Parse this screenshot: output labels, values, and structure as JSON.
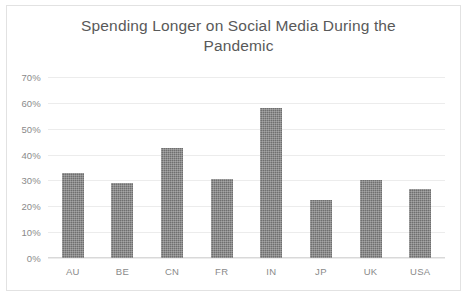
{
  "chart_data": {
    "type": "bar",
    "title": "Spending Longer on Social Media During the Pandemic",
    "title_line1": "Spending Longer on Social Media During the",
    "title_line2": "Pandemic",
    "categories": [
      "AU",
      "BE",
      "CN",
      "FR",
      "IN",
      "JP",
      "UK",
      "USA"
    ],
    "values": [
      33,
      29,
      42.5,
      30.5,
      58,
      22.5,
      30,
      26.5
    ],
    "series": [
      {
        "name": "Share spending longer on social media",
        "values": [
          33,
          29,
          42.5,
          30.5,
          58,
          22.5,
          30,
          26.5
        ]
      }
    ],
    "xlabel": "",
    "ylabel": "",
    "ylim": [
      0,
      70
    ],
    "ytick_values": [
      70,
      60,
      50,
      40,
      30,
      20,
      10,
      0
    ],
    "ytick_labels": [
      "70%",
      "60%",
      "50%",
      "40%",
      "30%",
      "20%",
      "10%",
      "0%"
    ],
    "grid": true,
    "grid_axis": "y",
    "legend": false,
    "legend_position": "none",
    "bar_color": "#6f6f6f",
    "grid_color": "#ececec",
    "axis_color": "#d9d9d9",
    "text_color": "#8a8a8a",
    "title_color": "#595959",
    "background": "#ffffff"
  }
}
